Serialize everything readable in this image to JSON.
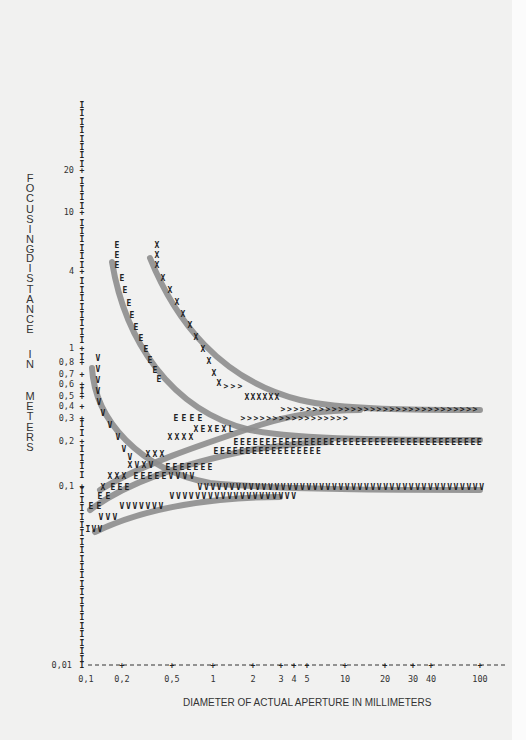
{
  "chart_data": {
    "type": "line",
    "title": "",
    "xlabel": "DIAMETER OF ACTUAL APERTURE IN MILLIMETERS",
    "ylabel": "FOCUSING DISTANCE IN METERS",
    "x_scale": "log",
    "y_scale": "log",
    "xlim": [
      0.1,
      100
    ],
    "ylim": [
      0.01,
      30
    ],
    "x_ticks": [
      "0,1",
      "0,2",
      "0,5",
      "1",
      "2",
      "3",
      "4",
      "5",
      "10",
      "20",
      "30",
      "40",
      "100"
    ],
    "y_ticks": [
      "0,01",
      "0,1",
      "0,2",
      "0,3",
      "0,4",
      "0,5",
      "0,6",
      "0,7",
      "0,8",
      "1",
      "4",
      "10",
      "20"
    ],
    "grid": false,
    "legend": null,
    "series": [
      {
        "name": "X (near limit, upper branch)",
        "marker": "X",
        "x": [
          0.3,
          0.35,
          0.45,
          0.6,
          0.8,
          1,
          1.5,
          2,
          3,
          5,
          10,
          30,
          100
        ],
        "y": [
          4.5,
          3.5,
          2.5,
          1.8,
          1.2,
          0.9,
          0.6,
          0.45,
          0.35,
          0.32,
          0.3,
          0.3,
          0.3
        ]
      },
      {
        "name": "E (near limit, upper branch)",
        "marker": "E",
        "x": [
          0.2,
          0.22,
          0.25,
          0.3,
          0.35,
          0.45,
          0.6,
          0.8,
          1,
          2,
          5,
          10,
          30,
          100
        ],
        "y": [
          4.5,
          3,
          2,
          1.3,
          0.9,
          0.6,
          0.4,
          0.3,
          0.25,
          0.2,
          0.19,
          0.18,
          0.18,
          0.18
        ]
      },
      {
        "name": "V (near limit, upper branch)",
        "marker": "V",
        "x": [
          0.12,
          0.13,
          0.15,
          0.18,
          0.2,
          0.25,
          0.3,
          0.5,
          1,
          3,
          10,
          100
        ],
        "y": [
          0.8,
          0.6,
          0.4,
          0.3,
          0.22,
          0.17,
          0.14,
          0.12,
          0.1,
          0.1,
          0.1,
          0.1
        ]
      },
      {
        "name": "X (far branch)",
        "marker": "X",
        "x": [
          0.12,
          0.15,
          0.2,
          0.3,
          0.5,
          1,
          2,
          5,
          10
        ],
        "y": [
          0.1,
          0.12,
          0.14,
          0.17,
          0.2,
          0.25,
          0.28,
          0.3,
          0.3
        ]
      },
      {
        "name": "E (far branch)",
        "marker": "E",
        "x": [
          0.1,
          0.15,
          0.2,
          0.3,
          0.5,
          1,
          2,
          5,
          10
        ],
        "y": [
          0.07,
          0.09,
          0.1,
          0.12,
          0.14,
          0.15,
          0.16,
          0.17,
          0.17
        ]
      },
      {
        "name": "V (far branch)",
        "marker": "V",
        "x": [
          0.1,
          0.12,
          0.15,
          0.2,
          0.3,
          0.5,
          1,
          2,
          5
        ],
        "y": [
          0.05,
          0.06,
          0.07,
          0.08,
          0.09,
          0.09,
          0.095,
          0.095,
          0.095
        ]
      }
    ]
  },
  "labels": {
    "y_title_words": [
      "FOCUSING",
      "DISTANCE",
      "IN",
      "METERS"
    ],
    "x_title": "DIAMETER OF ACTUAL APERTURE IN MILLIMETERS"
  },
  "colors": {
    "background": "#f1f1f0",
    "band": "#8d8d8d",
    "marks": "#222222"
  }
}
